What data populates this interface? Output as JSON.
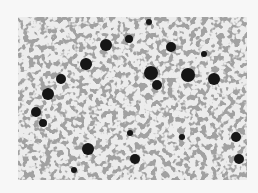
{
  "image": {
    "description": "Metallographic micrograph of nodular cast iron: dark graphite nodules in a light ferritic/pearlitic matrix with grain boundaries",
    "colors": {
      "background": "#f7f7f7",
      "matrix": "#e9e9e9",
      "boundary": "#6a6a6a",
      "nodule": "#141414"
    },
    "nodules": [
      {
        "x": 88,
        "y": 28,
        "r": 6
      },
      {
        "x": 111,
        "y": 22,
        "r": 4
      },
      {
        "x": 131,
        "y": 5,
        "r": 3
      },
      {
        "x": 153,
        "y": 30,
        "r": 5
      },
      {
        "x": 68,
        "y": 47,
        "r": 6
      },
      {
        "x": 43,
        "y": 62,
        "r": 5
      },
      {
        "x": 30,
        "y": 77,
        "r": 6
      },
      {
        "x": 133,
        "y": 56,
        "r": 7
      },
      {
        "x": 139,
        "y": 68,
        "r": 5
      },
      {
        "x": 170,
        "y": 58,
        "r": 7
      },
      {
        "x": 196,
        "y": 62,
        "r": 6
      },
      {
        "x": 186,
        "y": 37,
        "r": 3
      },
      {
        "x": 18,
        "y": 95,
        "r": 5
      },
      {
        "x": 25,
        "y": 106,
        "r": 4
      },
      {
        "x": 112,
        "y": 116,
        "r": 3
      },
      {
        "x": 70,
        "y": 132,
        "r": 6
      },
      {
        "x": 117,
        "y": 142,
        "r": 5
      },
      {
        "x": 218,
        "y": 120,
        "r": 5
      },
      {
        "x": 221,
        "y": 142,
        "r": 5
      },
      {
        "x": 164,
        "y": 120,
        "r": 3
      },
      {
        "x": 56,
        "y": 153,
        "r": 3
      }
    ]
  }
}
